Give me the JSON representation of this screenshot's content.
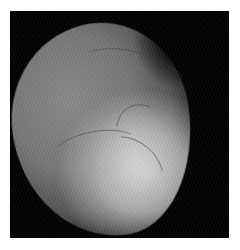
{
  "image": {
    "description": "Grayscale retinal fundus angiography image on black square background",
    "colors": {
      "background": "#ffffff",
      "frame": "#020202",
      "retina_dark": "#7a7a7a",
      "retina_bright": "#d7d7d7"
    }
  }
}
